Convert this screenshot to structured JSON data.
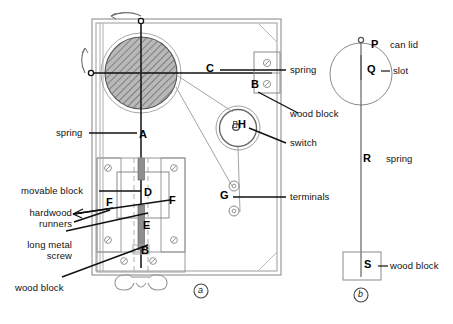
{
  "figure": {
    "panels": [
      {
        "id": "a",
        "marker": "a"
      },
      {
        "id": "b",
        "marker": "b"
      }
    ]
  },
  "panel_a": {
    "key_letters": [
      {
        "key": "A",
        "x": 143,
        "y": 137
      },
      {
        "key": "B",
        "x": 255,
        "y": 86
      },
      {
        "key": "B",
        "x": 144,
        "y": 252
      },
      {
        "key": "C",
        "x": 210,
        "y": 70
      },
      {
        "key": "D",
        "x": 147,
        "y": 195
      },
      {
        "key": "E",
        "x": 146,
        "y": 228
      },
      {
        "key": "F",
        "x": 110,
        "y": 205
      },
      {
        "key": "F",
        "x": 173,
        "y": 203
      },
      {
        "key": "G",
        "x": 224,
        "y": 197
      },
      {
        "key": "H",
        "x": 241,
        "y": 126
      }
    ],
    "labels": [
      {
        "name": "spring-left",
        "text": "spring",
        "side": "left"
      },
      {
        "name": "movable-block",
        "text": "movable block",
        "side": "left"
      },
      {
        "name": "hardwood-runners",
        "text": "hardwood runners",
        "side": "left"
      },
      {
        "name": "long-metal-screw",
        "text": "long metal screw",
        "side": "left"
      },
      {
        "name": "wood-block-bottom",
        "text": "wood block",
        "side": "left"
      },
      {
        "name": "spring-right",
        "text": "spring",
        "side": "right"
      },
      {
        "name": "wood-block-upper",
        "text": "wood block",
        "side": "right"
      },
      {
        "name": "switch",
        "text": "switch",
        "side": "right"
      },
      {
        "name": "terminals",
        "text": "terminals",
        "side": "right"
      }
    ],
    "panel_marker": "a"
  },
  "panel_b": {
    "key_letters": [
      {
        "key": "P",
        "x": 375,
        "y": 46
      },
      {
        "key": "Q",
        "x": 371,
        "y": 71
      },
      {
        "key": "R",
        "x": 367,
        "y": 160
      },
      {
        "key": "S",
        "x": 367,
        "y": 263
      }
    ],
    "labels": [
      {
        "name": "can-lid",
        "text": "can lid"
      },
      {
        "name": "slot",
        "text": "slot"
      },
      {
        "name": "spring",
        "text": "spring"
      },
      {
        "name": "wood-block",
        "text": "wood block"
      }
    ],
    "panel_marker": "b"
  },
  "colors": {
    "ink": "#111111",
    "line_light": "#9a9a9a",
    "line_mid": "#6d6d6d",
    "hatch": "#8c8c8c",
    "background": "#ffffff"
  }
}
